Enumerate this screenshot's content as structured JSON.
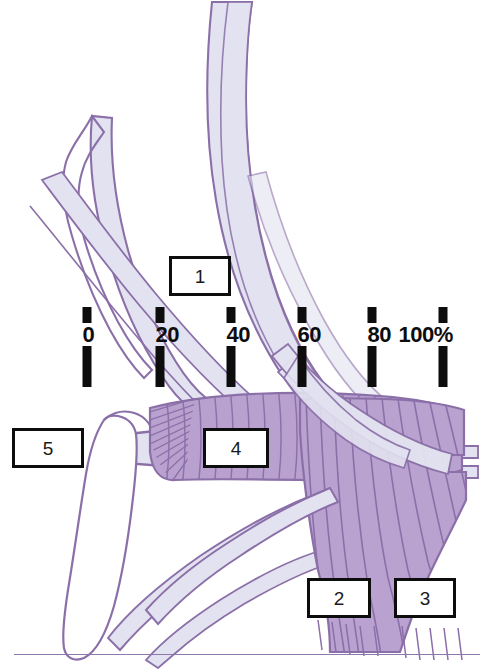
{
  "figure": {
    "background_color": "#ffffff"
  },
  "palette": {
    "outline_purple": "#8b6fa8",
    "pale_band_fill": "#e2e2f0",
    "muscle_fill": "#b9a2cf",
    "muscle_stripe": "#8b6fa8",
    "tick_black": "#0d0d0d",
    "box_border": "#0d0d0d",
    "box_fill": "#ffffff",
    "rule_color": "#8d77ab"
  },
  "scale": {
    "name": "percentage-scale",
    "unit": "%",
    "y_center": 341,
    "ticks": [
      {
        "label": "0",
        "value": 0,
        "x": 87
      },
      {
        "label": "20",
        "value": 20,
        "x": 160
      },
      {
        "label": "40",
        "value": 40,
        "x": 231
      },
      {
        "label": "60",
        "value": 60,
        "x": 302
      },
      {
        "label": "80",
        "value": 80,
        "x": 372
      },
      {
        "label": "100%",
        "value": 100,
        "x": 443
      }
    ]
  },
  "callouts": [
    {
      "id": "1",
      "label": "1",
      "x": 169,
      "y": 256,
      "w": 62,
      "h": 40
    },
    {
      "id": "5",
      "label": "5",
      "x": 12,
      "y": 428,
      "w": 72,
      "h": 40
    },
    {
      "id": "4",
      "label": "4",
      "x": 203,
      "y": 428,
      "w": 66,
      "h": 40
    },
    {
      "id": "2",
      "label": "2",
      "x": 307,
      "y": 578,
      "w": 64,
      "h": 40
    },
    {
      "id": "3",
      "label": "3",
      "x": 394,
      "y": 578,
      "w": 62,
      "h": 40
    }
  ],
  "structures": {
    "pale_bands_label": "pale lavender fibrous bands",
    "muscle_band_label": "horizontal striated muscle belly",
    "muscle_fan_label": "vertical striated muscle fan",
    "bone_label": "elongated bone outline"
  }
}
